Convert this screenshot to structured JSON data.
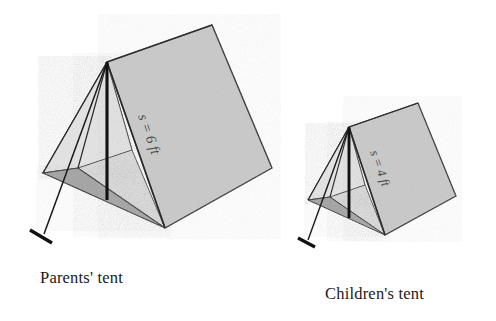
{
  "figure": {
    "background_color": "#ffffff",
    "width": 496,
    "height": 321
  },
  "colors": {
    "roof_panel": "#c9c9c9",
    "end_flap_light": "#ededed",
    "end_flap_mid": "#dcdcdc",
    "ground_triangle": "#a3a3a3",
    "outline": "#2b2b2b",
    "pole": "#111111",
    "label_text": "#1a1a1a",
    "dimension_text": "#4a4a4a"
  },
  "tents": [
    {
      "id": "parents-tent",
      "caption": "Parents' tent",
      "dimension_label": "s = 6 ft",
      "slant_height_value": 6,
      "units": "ft",
      "size": "large"
    },
    {
      "id": "children-tent",
      "caption": "Children's tent",
      "dimension_label": "s = 4 ft",
      "slant_height_value": 4,
      "units": "ft",
      "size": "small"
    }
  ],
  "parts": {
    "roof_panel": "roof-panel",
    "end_flap": "end-flap",
    "ground_triangle": "ground-triangle",
    "center_pole": "center-pole",
    "guy_line": "guy-line",
    "stake": "stake"
  }
}
